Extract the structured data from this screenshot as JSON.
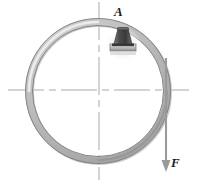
{
  "figure": {
    "name": "ring-with-applied-force-diagram",
    "width": 197,
    "height": 182,
    "background_color": "#ffffff"
  },
  "labels": {
    "point_a": "A",
    "force_f": "F"
  },
  "annotations": {
    "point_a_description": "label for block mounted on inside of ring near top",
    "force_f_description": "downward force applied tangentially at right side of ring"
  },
  "elements": {
    "ring": {
      "name": "ring",
      "center_x": 98,
      "center_y": 91,
      "radius": 69,
      "thickness": 6,
      "outline_color": "#6e6e6e",
      "fill_light": "#e4e4e4",
      "fill_mid": "#b8b8b8",
      "fill_dark": "#8a8a8a"
    },
    "block": {
      "name": "mounted-block",
      "x": 110,
      "y": 29,
      "width": 26,
      "height": 23,
      "body_color": "#5a5a5a",
      "base_color": "#3c3c3c",
      "plate_color": "#cfcfcf"
    },
    "force_arrow": {
      "name": "force-arrow",
      "x": 166,
      "y_start": 58,
      "y_end": 170,
      "color": "#9a9a9a",
      "direction": "down"
    },
    "centerlines": {
      "name": "centerlines",
      "color": "#a9a9a9",
      "horizontal_y": 90,
      "vertical_x": 99,
      "style": "dash-dot"
    }
  },
  "colors": {
    "ink": "#1a1a1a",
    "line": "#a9a9a9",
    "ring_stroke": "#707070",
    "arrow": "#9a9a9a",
    "background": "#ffffff"
  }
}
